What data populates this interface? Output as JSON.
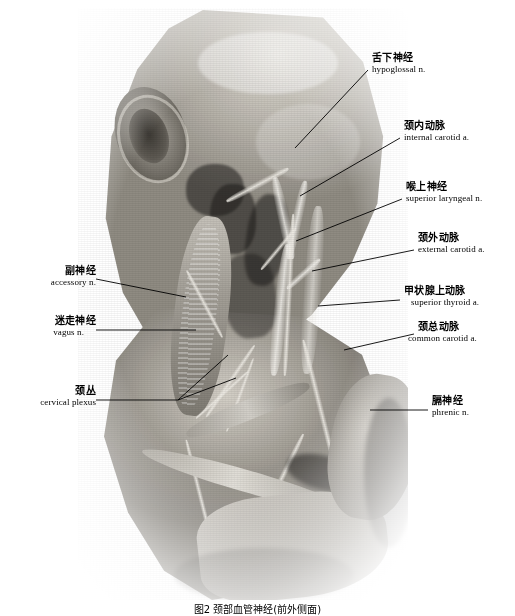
{
  "figure": {
    "title_cn": "颈部血管神经",
    "caption": "图2  颈部血管神经(前外侧面)",
    "background_color": "#ffffff",
    "ink_color": "#000000",
    "specimen_type": "cadaveric neck dissection photograph (grayscale)"
  },
  "labels": [
    {
      "id": "hypoglossal-nerve",
      "cn": "舌下神经",
      "en": "hypoglossal n.",
      "side": "right",
      "text_x": 372,
      "text_y": 57,
      "leader": [
        [
          368,
          70
        ],
        [
          295,
          148
        ]
      ]
    },
    {
      "id": "internal-carotid-artery",
      "cn": "颈内动脉",
      "en": "internal carotid a.",
      "side": "right",
      "text_x": 404,
      "text_y": 125,
      "leader": [
        [
          400,
          138
        ],
        [
          300,
          196
        ]
      ]
    },
    {
      "id": "superior-laryngeal-nerve",
      "cn": "喉上神经",
      "en": "superior laryngeal n.",
      "side": "right",
      "text_x": 406,
      "text_y": 186,
      "leader": [
        [
          402,
          199
        ],
        [
          296,
          241
        ]
      ]
    },
    {
      "id": "external-carotid-artery",
      "cn": "颈外动脉",
      "en": "external carotid a.",
      "side": "right",
      "text_x": 418,
      "text_y": 237,
      "leader": [
        [
          414,
          250
        ],
        [
          312,
          271
        ]
      ]
    },
    {
      "id": "superior-thyroid-artery",
      "cn": "甲状腺上动脉",
      "en": "superior thyroid a.",
      "side": "right",
      "text_x": 404,
      "text_y": 290,
      "leader": [
        [
          400,
          300
        ],
        [
          318,
          306
        ]
      ]
    },
    {
      "id": "common-carotid-artery",
      "cn": "颈总动脉",
      "en": "common carotid a.",
      "side": "right",
      "text_x": 418,
      "text_y": 326,
      "leader": [
        [
          414,
          334
        ],
        [
          344,
          350
        ]
      ]
    },
    {
      "id": "phrenic-nerve",
      "cn": "膈神经",
      "en": "phrenic n.",
      "side": "right",
      "text_x": 432,
      "text_y": 400,
      "leader": [
        [
          428,
          410
        ],
        [
          370,
          410
        ]
      ]
    },
    {
      "id": "accessory-nerve",
      "cn": "副神经",
      "en": "accessory n.",
      "side": "left",
      "text_x": 92,
      "text_y": 270,
      "leader": [
        [
          96,
          279
        ],
        [
          186,
          297
        ]
      ]
    },
    {
      "id": "vagus-nerve",
      "cn": "迷走神经",
      "en": "vagus n.",
      "side": "left",
      "text_x": 92,
      "text_y": 320,
      "leader": [
        [
          96,
          330
        ],
        [
          196,
          330
        ]
      ]
    },
    {
      "id": "cervical-plexus",
      "cn": "颈丛",
      "en": "cervical plexus",
      "side": "left",
      "text_x": 92,
      "text_y": 390,
      "leader": [
        [
          96,
          400
        ],
        [
          178,
          400
        ]
      ],
      "branches": [
        [
          [
            178,
            400
          ],
          [
            228,
            355
          ]
        ],
        [
          [
            178,
            400
          ],
          [
            236,
            378
          ]
        ]
      ]
    }
  ]
}
